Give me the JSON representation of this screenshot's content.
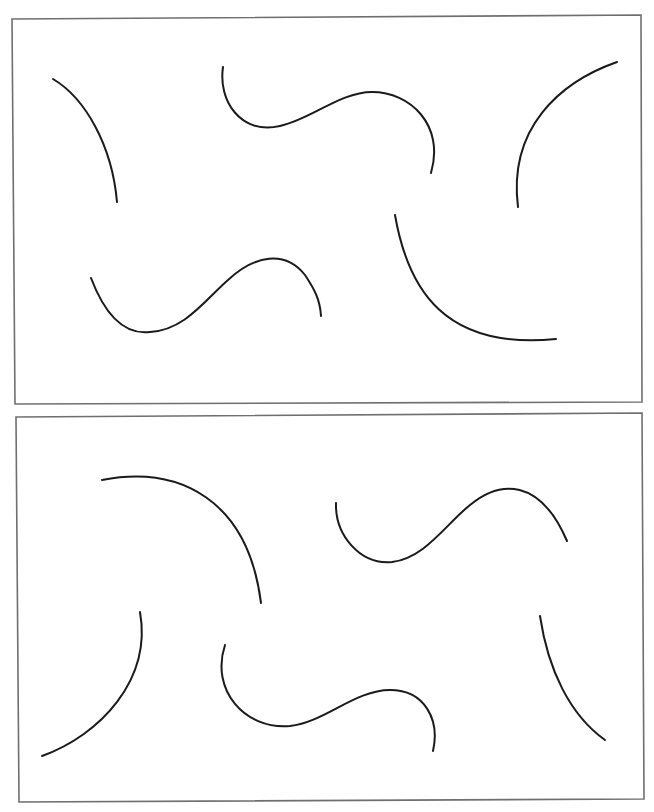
{
  "page": {
    "width": 654,
    "height": 812,
    "background": "#ffffff"
  },
  "style": {
    "frame_color": "#6f6f6f",
    "curve_color": "#1a1a1a"
  },
  "panels": [
    {
      "name": "top-panel",
      "frame": "12,19 641,15 642,402 15,404",
      "curves": [
        {
          "name": "curve-top-left-arc",
          "d": "M 53 79 C 85 98, 112 145, 117 202"
        },
        {
          "name": "curve-top-center-wave",
          "d": "M 223 67 C 218 100, 240 135, 280 126 C 310 120, 340 92, 372 92 C 410 92, 445 125, 431 173"
        },
        {
          "name": "curve-top-right-arc",
          "d": "M 617 62 C 560 82, 508 128, 518 207"
        },
        {
          "name": "curve-top-bottom-left-wave",
          "d": "M 91 278 C 105 315, 125 335, 150 332 C 185 330, 205 300, 228 280 C 255 255, 285 250, 305 275 C 315 290, 320 300, 321 316"
        },
        {
          "name": "curve-top-bottom-right-arc",
          "d": "M 395 215 C 408 290, 445 350, 556 339"
        }
      ]
    },
    {
      "name": "bottom-panel",
      "frame": "16,417 642,413 644,799 19,802",
      "curves": [
        {
          "name": "curve-bottom-top-left-arc",
          "d": "M 102 480 C 180 465, 248 500, 261 603"
        },
        {
          "name": "curve-bottom-top-right-wave",
          "d": "M 336 503 C 335 535, 360 565, 392 562 C 425 558, 445 525, 470 505 C 500 480, 540 478, 567 541"
        },
        {
          "name": "curve-bottom-left-arc",
          "d": "M 140 612 C 152 680, 100 735, 42 756"
        },
        {
          "name": "curve-bottom-center-wave",
          "d": "M 225 645 C 210 690, 245 730, 290 726 C 325 722, 355 690, 390 690 C 425 690, 440 720, 433 751"
        },
        {
          "name": "curve-bottom-right-arc",
          "d": "M 540 616 C 548 670, 570 715, 605 740"
        }
      ]
    }
  ]
}
